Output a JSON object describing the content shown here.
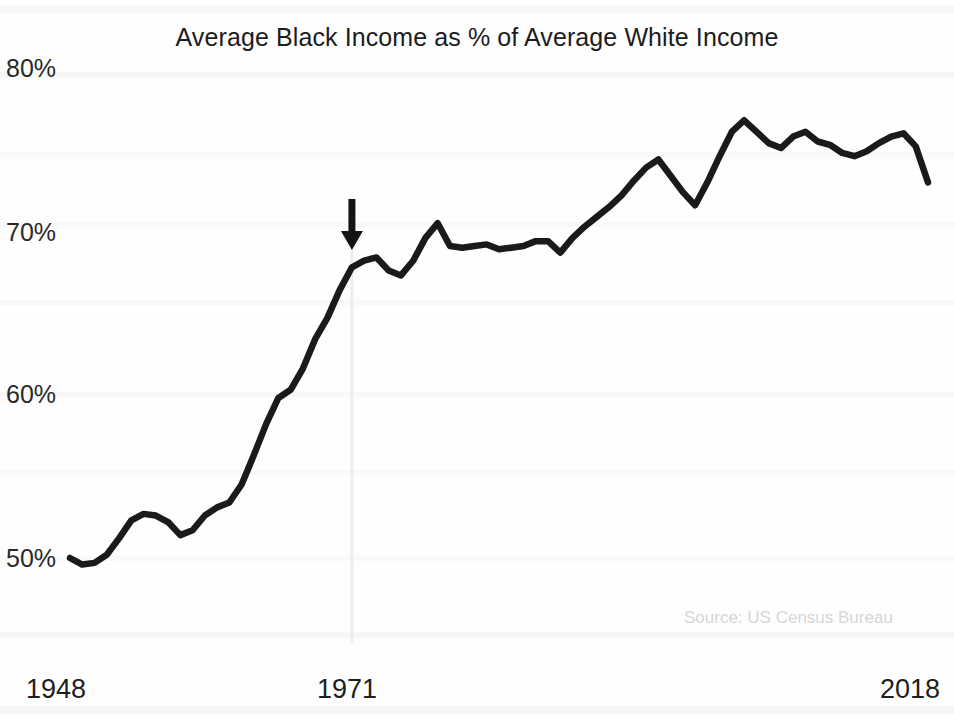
{
  "chart_data": {
    "type": "line",
    "title": "Average Black Income as % of Average White Income",
    "subtitle": "",
    "xlabel": "",
    "ylabel": "",
    "source": "Source: US Census Bureau",
    "grid": false,
    "legend": "none",
    "xlim": [
      1948,
      2018
    ],
    "ylim": [
      50,
      80
    ],
    "ytick_labels": [
      "80%",
      "70%",
      "60%",
      "50%"
    ],
    "ytick_values": [
      80,
      70,
      60,
      50
    ],
    "xtick_labels": [
      "1948",
      "1971",
      "2018"
    ],
    "xtick_values": [
      1948,
      1971,
      2018
    ],
    "series": [
      {
        "name": "Average Black Income as % of Average White Income",
        "color": "#1a1a1a",
        "x": [
          1948,
          1949,
          1950,
          1951,
          1952,
          1953,
          1954,
          1955,
          1956,
          1957,
          1958,
          1959,
          1960,
          1961,
          1962,
          1963,
          1964,
          1965,
          1966,
          1967,
          1968,
          1969,
          1970,
          1971,
          1972,
          1973,
          1974,
          1975,
          1976,
          1977,
          1978,
          1979,
          1980,
          1981,
          1982,
          1983,
          1984,
          1985,
          1986,
          1987,
          1988,
          1989,
          1990,
          1991,
          1992,
          1993,
          1994,
          1995,
          1996,
          1997,
          1998,
          1999,
          2000,
          2001,
          2002,
          2003,
          2004,
          2005,
          2006,
          2007,
          2008,
          2009,
          2010,
          2011,
          2012,
          2013,
          2014,
          2015,
          2016,
          2017,
          2018
        ],
        "y": [
          50.0,
          49.6,
          49.7,
          50.2,
          51.2,
          52.3,
          52.7,
          52.6,
          52.2,
          51.4,
          51.7,
          52.6,
          53.1,
          53.4,
          54.5,
          56.3,
          58.2,
          59.8,
          60.3,
          61.6,
          63.4,
          64.7,
          66.4,
          67.8,
          68.2,
          68.4,
          67.6,
          67.3,
          68.2,
          69.6,
          70.5,
          69.1,
          69.0,
          69.1,
          69.2,
          68.9,
          69.0,
          69.1,
          69.4,
          69.4,
          68.7,
          69.6,
          70.3,
          70.9,
          71.5,
          72.2,
          73.1,
          73.9,
          74.4,
          73.4,
          72.4,
          71.6,
          73.0,
          74.6,
          76.1,
          76.8,
          76.1,
          75.4,
          75.1,
          75.8,
          76.1,
          75.5,
          75.3,
          74.8,
          74.6,
          74.9,
          75.4,
          75.8,
          76.0,
          75.2,
          73.0
        ]
      }
    ],
    "annotations": [
      {
        "type": "arrow",
        "name": "year-1971-arrow",
        "direction": "down",
        "at_x": 1971,
        "label": ""
      },
      {
        "type": "vertical-line",
        "name": "year-1971-guide",
        "at_x": 1971,
        "color": "#ededed",
        "label": ""
      }
    ]
  }
}
